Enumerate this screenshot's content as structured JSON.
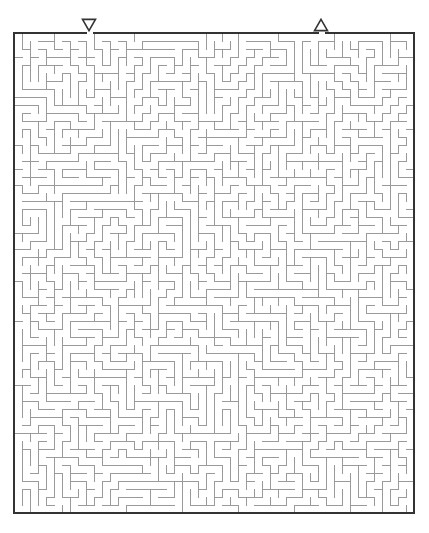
{
  "figure": {
    "kind": "maze-puzzle",
    "title": "",
    "background_color": "#ffffff",
    "width": 429,
    "height": 533
  },
  "maze": {
    "origin_x": 14,
    "origin_y": 33,
    "cell_size": 8,
    "columns": 50,
    "rows": 60,
    "width": 401,
    "height": 480,
    "wall_color": "#9a9a9a",
    "wall_width": 1,
    "border_color": "#333333",
    "border_width": 2,
    "path_color": "#ffffff"
  },
  "markers": {
    "entrance": {
      "icon": "triangle-down-icon",
      "glyph": "▽",
      "label": "Entrance",
      "column": 9,
      "center_x": 89,
      "center_y": 25,
      "size": 13,
      "color": "#333333"
    },
    "exit": {
      "icon": "triangle-up-icon",
      "glyph": "△",
      "label": "Exit",
      "column": 38,
      "center_x": 321,
      "center_y": 25,
      "size": 13,
      "color": "#333333"
    }
  },
  "openings": {
    "top": [
      {
        "name": "entrance-gap",
        "column": 9
      },
      {
        "name": "exit-gap",
        "column": 38
      }
    ],
    "bottom": [],
    "left": [],
    "right": []
  },
  "seed": 20240517
}
